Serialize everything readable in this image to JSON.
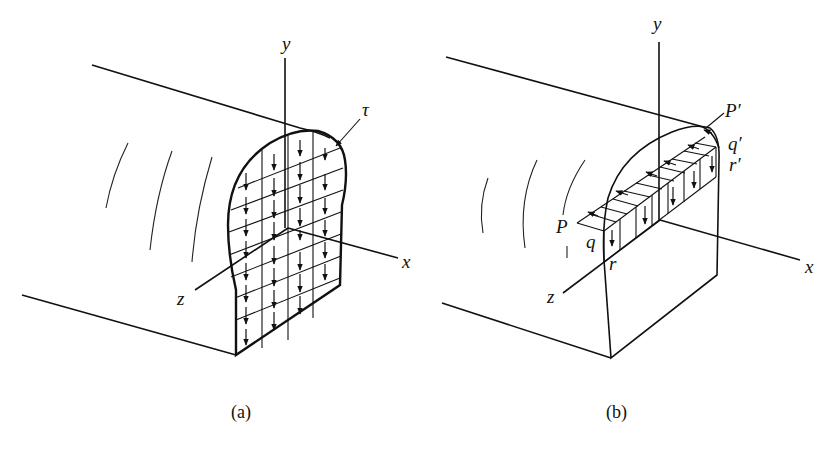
{
  "figure": {
    "panels": [
      {
        "id": "a",
        "caption": "(a)",
        "axes": {
          "y": "y",
          "x": "x",
          "z": "z"
        },
        "annotations": {
          "tau": "τ"
        },
        "description": "Beam cross-section with grid of downward shear stress arrows"
      },
      {
        "id": "b",
        "caption": "(b)",
        "axes": {
          "y": "y",
          "x": "x",
          "z": "z"
        },
        "annotations": {
          "P": "P",
          "q": "q",
          "r": "r",
          "P_prime": "P′",
          "q_prime": "q′",
          "r_prime": "r′"
        },
        "description": "Beam section with horizontal strip PP′ showing longitudinal and vertical shear stress arrows"
      }
    ],
    "colors": {
      "line": "#111111",
      "background": "#ffffff"
    }
  }
}
